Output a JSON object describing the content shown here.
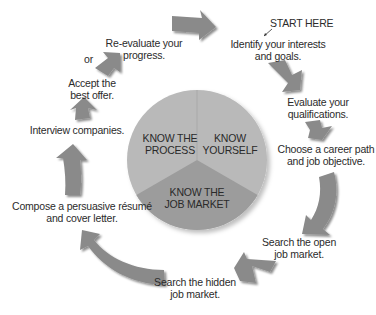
{
  "diagram": {
    "colors": {
      "upper_segments": "#b9b9b9",
      "lower_segment": "#9c9c9c",
      "arrow_fill": "#8a8a8a",
      "arrow_shadow": "#5e5e5e",
      "text": "#2b2b2b"
    },
    "center": {
      "segments": [
        {
          "id": "process",
          "line1": "KNOW THE",
          "line2": "PROCESS"
        },
        {
          "id": "yourself",
          "line1": "KNOW",
          "line2": "YOURSELF"
        },
        {
          "id": "market",
          "line1": "KNOW THE",
          "line2": "JOB MARKET"
        }
      ]
    },
    "start_marker": "START HERE",
    "steps": [
      {
        "line1": "Identify your interests",
        "line2": "and goals."
      },
      {
        "line1": "Evaluate your",
        "line2": "qualifications."
      },
      {
        "line1": "Choose a career path",
        "line2": "and job objective."
      },
      {
        "line1": "Search the open",
        "line2": "job market."
      },
      {
        "line1": "Search the hidden",
        "line2": "job market."
      },
      {
        "line1": "Compose a persuasive résumé",
        "line2": "and cover letter."
      },
      {
        "line1": "Interview companies.",
        "line2": ""
      },
      {
        "line1": "Accept the",
        "line2": "best offer."
      },
      {
        "line1": "Re-evaluate your",
        "line2": "progress."
      }
    ],
    "or_label": "or"
  }
}
